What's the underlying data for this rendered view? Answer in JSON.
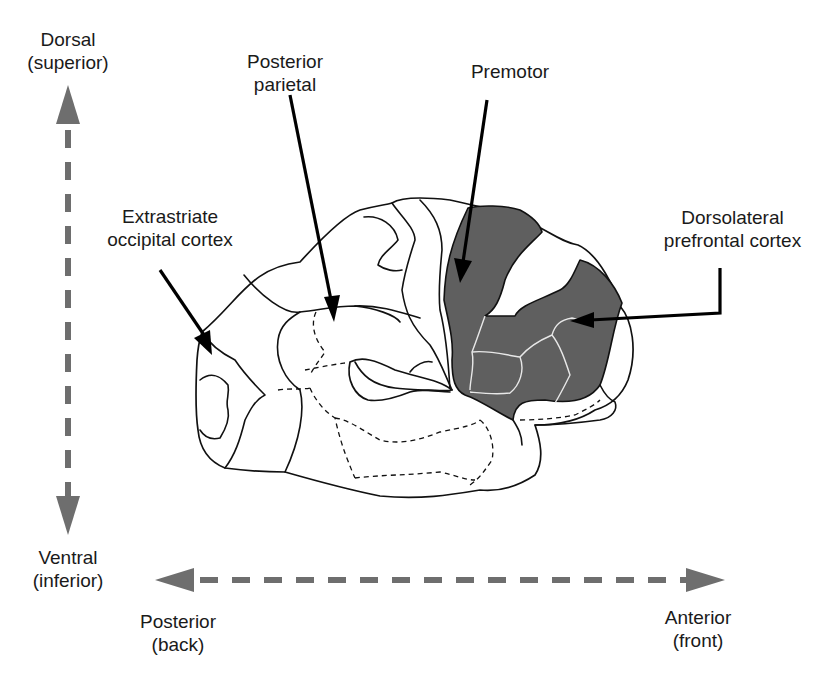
{
  "axes": {
    "dorsal": {
      "line1": "Dorsal",
      "line2": "(superior)"
    },
    "ventral": {
      "line1": "Ventral",
      "line2": "(inferior)"
    },
    "posterior": {
      "line1": "Posterior",
      "line2": "(back)"
    },
    "anterior": {
      "line1": "Anterior",
      "line2": "(front)"
    },
    "arrow_color": "#6e6e6e"
  },
  "regions": {
    "extrastriate": {
      "line1": "Extrastriate",
      "line2": "occipital cortex"
    },
    "posterior_parietal": {
      "line1": "Posterior",
      "line2": "parietal"
    },
    "premotor": {
      "line1": "Premotor"
    },
    "dlpfc": {
      "line1": "Dorsolateral",
      "line2": "prefrontal cortex"
    }
  },
  "colors": {
    "highlight_fill": "#5f5f5f",
    "outline": "#111111",
    "background": "#ffffff"
  }
}
